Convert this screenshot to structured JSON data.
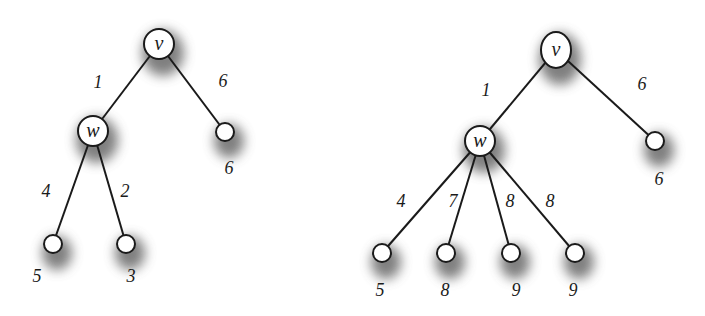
{
  "diagram": {
    "type": "weighted-tree-comparison",
    "trees": [
      {
        "id": "left",
        "nodes": [
          {
            "id": "v",
            "label": "v",
            "x": 159,
            "y": 44,
            "rx": 15,
            "ry": 15,
            "shadow": true
          },
          {
            "id": "w",
            "label": "w",
            "x": 93,
            "y": 131,
            "rx": 15,
            "ry": 15,
            "shadow": true
          },
          {
            "id": "r",
            "label": "",
            "value": "6",
            "x": 225,
            "y": 132,
            "rx": 9,
            "ry": 9,
            "value_x": 229,
            "value_y": 174
          },
          {
            "id": "a",
            "label": "",
            "value": "5",
            "x": 53,
            "y": 244,
            "rx": 9,
            "ry": 9,
            "value_x": 37,
            "value_y": 282
          },
          {
            "id": "b",
            "label": "",
            "value": "3",
            "x": 126,
            "y": 244,
            "rx": 9,
            "ry": 9,
            "value_x": 131,
            "value_y": 282
          }
        ],
        "edges": [
          {
            "from": "v",
            "to": "w",
            "weight": "1",
            "label_x": 98,
            "label_y": 88
          },
          {
            "from": "v",
            "to": "r",
            "weight": "6",
            "label_x": 223,
            "label_y": 87
          },
          {
            "from": "w",
            "to": "a",
            "weight": "4",
            "label_x": 46,
            "label_y": 197
          },
          {
            "from": "w",
            "to": "b",
            "weight": "2",
            "label_x": 125,
            "label_y": 197
          }
        ]
      },
      {
        "id": "right",
        "nodes": [
          {
            "id": "v",
            "label": "v",
            "x": 556,
            "y": 50,
            "rx": 15,
            "ry": 18,
            "shadow": true
          },
          {
            "id": "w",
            "label": "w",
            "x": 480,
            "y": 141,
            "rx": 15,
            "ry": 15,
            "shadow": true
          },
          {
            "id": "r",
            "label": "",
            "value": "6",
            "x": 655,
            "y": 141,
            "rx": 9,
            "ry": 9,
            "value_x": 659,
            "value_y": 185
          },
          {
            "id": "a",
            "label": "",
            "value": "5",
            "x": 382,
            "y": 253,
            "rx": 9,
            "ry": 9,
            "value_x": 380,
            "value_y": 296
          },
          {
            "id": "b",
            "label": "",
            "value": "8",
            "x": 446,
            "y": 253,
            "rx": 9,
            "ry": 9,
            "value_x": 445,
            "value_y": 296
          },
          {
            "id": "c",
            "label": "",
            "value": "9",
            "x": 511,
            "y": 253,
            "rx": 9,
            "ry": 9,
            "value_x": 516,
            "value_y": 296
          },
          {
            "id": "d",
            "label": "",
            "value": "9",
            "x": 575,
            "y": 253,
            "rx": 9,
            "ry": 9,
            "value_x": 573,
            "value_y": 296
          }
        ],
        "edges": [
          {
            "from": "v",
            "to": "w",
            "weight": "1",
            "label_x": 486,
            "label_y": 96
          },
          {
            "from": "v",
            "to": "r",
            "weight": "6",
            "label_x": 642,
            "label_y": 90
          },
          {
            "from": "w",
            "to": "a",
            "weight": "4",
            "label_x": 401,
            "label_y": 207
          },
          {
            "from": "w",
            "to": "b",
            "weight": "7",
            "label_x": 453,
            "label_y": 207
          },
          {
            "from": "w",
            "to": "c",
            "weight": "8",
            "label_x": 510,
            "label_y": 207
          },
          {
            "from": "w",
            "to": "d",
            "weight": "8",
            "label_x": 550,
            "label_y": 207
          }
        ]
      }
    ],
    "colors": {
      "stroke": "#1a1a1a",
      "node_fill": "#ffffff",
      "shadow": "#555555",
      "background": "#ffffff"
    }
  }
}
